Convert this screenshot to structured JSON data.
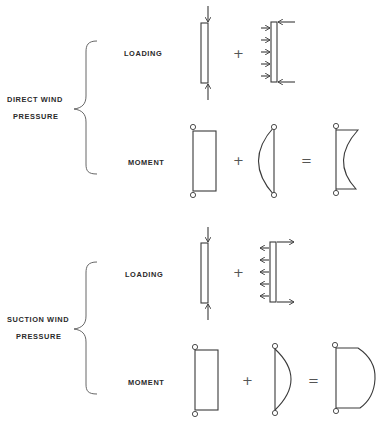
{
  "sections": [
    {
      "id": "direct",
      "title_line1": "DIRECT WIND",
      "title_line2": "PRESSURE",
      "loading_label": "LOADING",
      "moment_label": "MOMENT",
      "loading_operator": "+",
      "moment_operators": [
        "+",
        "="
      ],
      "lateral_load_direction": "toward-member",
      "lateral_arrow_count": 5,
      "resultant_moment_shape": "concave"
    },
    {
      "id": "suction",
      "title_line1": "SUCTION WIND",
      "title_line2": "PRESSURE",
      "loading_label": "LOADING",
      "moment_label": "MOMENT",
      "loading_operator": "+",
      "moment_operators": [
        "+",
        "="
      ],
      "lateral_load_direction": "away-from-member",
      "lateral_arrow_count": 5,
      "resultant_moment_shape": "convex"
    }
  ],
  "colors": {
    "line": "#3a3a3a",
    "text": "#2a2a2a",
    "background": "#ffffff"
  }
}
